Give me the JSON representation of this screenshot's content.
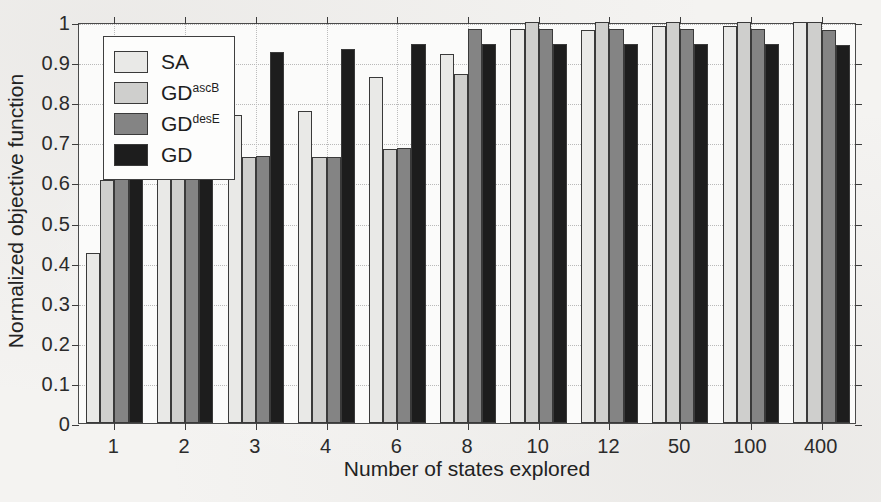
{
  "chart_data": {
    "type": "bar",
    "title": "",
    "xlabel": "Number of states explored",
    "ylabel": "Normalized objective function",
    "categories": [
      "1",
      "2",
      "3",
      "4",
      "6",
      "8",
      "10",
      "12",
      "50",
      "100",
      "400"
    ],
    "ylim": [
      0,
      1
    ],
    "ytick_labels": [
      "0",
      "0.1",
      "0.2",
      "0.3",
      "0.4",
      "0.5",
      "0.6",
      "0.7",
      "0.8",
      "0.9",
      "1"
    ],
    "ytick_values": [
      0,
      0.1,
      0.2,
      0.3,
      0.4,
      0.5,
      0.6,
      0.7,
      0.8,
      0.9,
      1
    ],
    "grid": true,
    "legend_position": "upper-left",
    "series": [
      {
        "name": "SA",
        "label_base": "SA",
        "label_sup": "",
        "color": "#e9e9e7",
        "values": [
          0.425,
          0.633,
          0.767,
          0.777,
          0.864,
          0.921,
          0.982,
          0.979,
          0.989,
          0.989,
          1.0
        ]
      },
      {
        "name": "GD-ascB",
        "label_base": "GD",
        "label_sup": "ascB",
        "color": "#cfcfcd",
        "values": [
          0.607,
          0.658,
          0.664,
          0.664,
          0.683,
          0.871,
          1.0,
          1.0,
          1.0,
          1.0,
          1.0
        ]
      },
      {
        "name": "GD-desE",
        "label_base": "GD",
        "label_sup": "desE",
        "color": "#848484",
        "values": [
          0.66,
          0.66,
          0.665,
          0.664,
          0.685,
          0.983,
          0.982,
          0.982,
          0.982,
          0.982,
          0.98
        ]
      },
      {
        "name": "GD",
        "label_base": "GD",
        "label_sup": "",
        "color": "#1d1d1d",
        "values": [
          0.924,
          0.924,
          0.924,
          0.933,
          0.944,
          0.944,
          0.944,
          0.944,
          0.944,
          0.944,
          0.943
        ]
      }
    ]
  }
}
